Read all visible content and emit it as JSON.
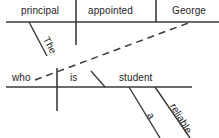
{
  "diagram": {
    "type": "reed-kellogg-sentence-diagram",
    "sentence": "The principal appointed George, who is a reliable student.",
    "ink_color": "#3a3a3a",
    "text_color": "#1c1c1c",
    "background_color": "#ffffff",
    "main_clause": {
      "subject": "principal",
      "verb": "appointed",
      "direct_object": "George",
      "subject_modifier": "The"
    },
    "relative_clause": {
      "relative_pronoun": "who",
      "linking_verb": "is",
      "predicate_nominative": "student",
      "modifiers": [
        "a",
        "reliable"
      ]
    },
    "words": {
      "subject": "principal",
      "verb": "appointed",
      "object": "George",
      "article_the": "The",
      "who": "who",
      "is": "is",
      "student": "student",
      "article_a": "a",
      "adjective": "reliable"
    },
    "lines": {
      "top_baseline": "main clause baseline",
      "bottom_baseline": "relative clause baseline",
      "dashed_connector": "relative pronoun to antecedent"
    }
  }
}
